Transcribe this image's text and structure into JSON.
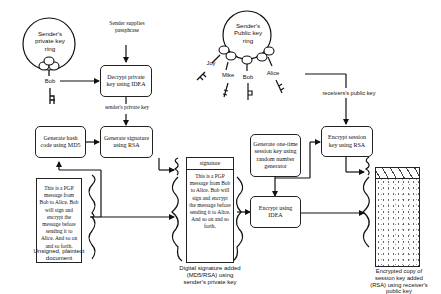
{
  "diagram": {
    "rings": {
      "private": {
        "label": "Sender's private key ring",
        "key_owner": "Bob"
      },
      "public": {
        "label": "Sender's Public key ring",
        "key_owners": [
          "Joy",
          "Mike",
          "Bob",
          "Alice"
        ]
      }
    },
    "annotations": {
      "passphrase": "Sender supplies passphrase",
      "senders_private_key": "sender's private key",
      "receivers_public_key": "receivers's public key"
    },
    "boxes": {
      "decrypt_private_key": "Decrypt private key using IDEA",
      "generate_hash": "Generate hash code using MD5",
      "generate_signature": "Generate signature using RSA",
      "generate_session_key": "Generate one-time session key using random number generator",
      "encrypt_session_key": "Encrypt session key using RSA",
      "encrypt_idea": "Encrypt using IDEA"
    },
    "documents": {
      "message_text": "This is a PGP message from Bob to Alice. Bob will sign and encrypt the message before sending it to Alice. And so on and so forth.",
      "signature_header": "signature"
    },
    "captions": {
      "unsigned": "Unsigned, plaintext document",
      "signed": "Digital signature added (MD5/RSA) using sender's private key",
      "encrypted": "Encrypted copy of session key added (RSA) using receiver's public key"
    }
  }
}
